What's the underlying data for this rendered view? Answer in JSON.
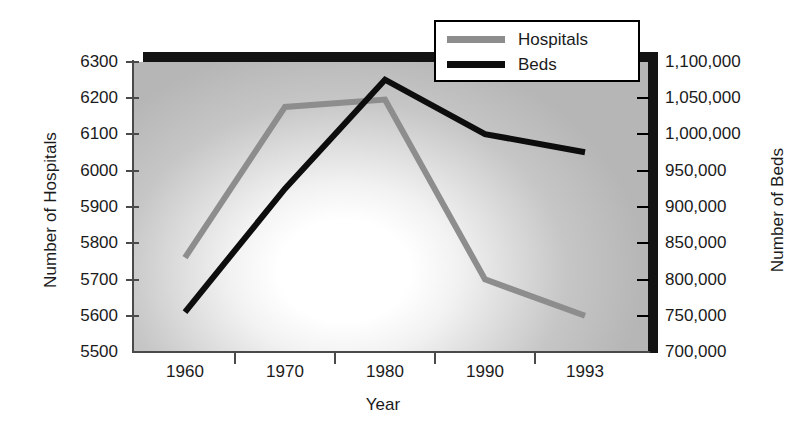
{
  "chart_data": {
    "type": "line",
    "title": "",
    "xlabel": "Year",
    "ylabel": "Number of Hospitals",
    "y2label": "Number of Beds",
    "categories": [
      "1960",
      "1970",
      "1980",
      "1990",
      "1993"
    ],
    "grid": false,
    "legend_position": "top-right",
    "axes": {
      "left": {
        "label": "Number of Hospitals",
        "ticks": [
          "6300",
          "6200",
          "6100",
          "6000",
          "5900",
          "5800",
          "5700",
          "5600",
          "5500"
        ],
        "tick_values": [
          6300,
          6200,
          6100,
          6000,
          5900,
          5800,
          5700,
          5600,
          5500
        ],
        "min": 5500,
        "max": 6300
      },
      "right": {
        "label": "Number of Beds",
        "ticks": [
          "1,100,000",
          "1,050,000",
          "1,000,000",
          "950,000",
          "900,000",
          "850,000",
          "800,000",
          "750,000",
          "700,000"
        ],
        "tick_values": [
          1100000,
          1050000,
          1000000,
          950000,
          900000,
          850000,
          800000,
          750000,
          700000
        ],
        "min": 700000,
        "max": 1100000
      },
      "x": {
        "label": "Year",
        "ticks": [
          "1960",
          "1970",
          "1980",
          "1990",
          "1993"
        ]
      }
    },
    "series": [
      {
        "name": "Hospitals",
        "axis": "left",
        "color": "#8d8d8d",
        "values": [
          5760,
          6175,
          6195,
          5700,
          5600
        ]
      },
      {
        "name": "Beds",
        "axis": "right",
        "color": "#0d0d0d",
        "values": [
          755000,
          925000,
          1075000,
          1000000,
          975000
        ]
      }
    ]
  },
  "legend": {
    "items": [
      {
        "label": "Hospitals",
        "color": "#8d8d8d"
      },
      {
        "label": "Beds",
        "color": "#0d0d0d"
      }
    ]
  },
  "left_labels": {
    "t0": "6300",
    "t1": "6200",
    "t2": "6100",
    "t3": "6000",
    "t4": "5900",
    "t5": "5800",
    "t6": "5700",
    "t7": "5600",
    "t8": "5500"
  },
  "right_labels": {
    "t0": "1,100,000",
    "t1": "1,050,000",
    "t2": "1,000,000",
    "t3": "950,000",
    "t4": "900,000",
    "t5": "850,000",
    "t6": "800,000",
    "t7": "750,000",
    "t8": "700,000"
  },
  "x_labels": {
    "t0": "1960",
    "t1": "1970",
    "t2": "1980",
    "t3": "1990",
    "t4": "1993"
  },
  "titles": {
    "left_axis": "Number of Hospitals",
    "right_axis": "Number of Beds",
    "x_axis": "Year"
  },
  "colors": {
    "hospitals": "#8d8d8d",
    "beds": "#0d0d0d",
    "frame": "#131313",
    "axis": "#4a4a4a"
  }
}
